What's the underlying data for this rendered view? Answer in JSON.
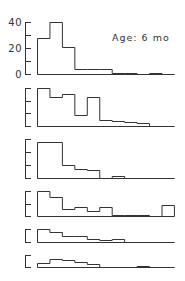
{
  "chart_data": {
    "type": "bar",
    "subtype": "stacked-panels-histogram",
    "annotation": "Age: 6 mo",
    "bins": 11,
    "x_tick_labels": [],
    "xlabel": "",
    "ylabel": "",
    "grid": false,
    "panels": [
      {
        "name": "panel-1",
        "y_tick_labels": [
          "40",
          "20",
          "0"
        ],
        "ylim": [
          0,
          40
        ],
        "y_ticks": [
          0,
          10,
          20,
          30,
          40
        ],
        "values": [
          28,
          40,
          21,
          4,
          4,
          4,
          1,
          1,
          0,
          1,
          0
        ]
      },
      {
        "name": "panel-2",
        "y_tick_labels": [],
        "ylim": [
          0,
          3
        ],
        "y_ticks": [
          0,
          1,
          2,
          3
        ],
        "values": [
          3.0,
          2.3,
          2.5,
          0.9,
          2.3,
          0.5,
          0.4,
          0.3,
          0.2,
          0,
          0
        ]
      },
      {
        "name": "panel-3",
        "y_tick_labels": [],
        "ylim": [
          0,
          3
        ],
        "y_ticks": [
          0,
          1,
          2,
          3
        ],
        "values": [
          2.8,
          2.8,
          1.0,
          0.7,
          0.6,
          0,
          0.15,
          0,
          0,
          0,
          0
        ]
      },
      {
        "name": "panel-4",
        "y_tick_labels": [],
        "ylim": [
          0,
          2
        ],
        "y_ticks": [
          0,
          1,
          2
        ],
        "values": [
          2.0,
          1.5,
          0.55,
          0.75,
          0.4,
          0.75,
          0.1,
          0.1,
          0.1,
          0,
          0.9
        ]
      },
      {
        "name": "panel-5",
        "y_tick_labels": [],
        "ylim": [
          0,
          1
        ],
        "y_ticks": [
          0,
          1
        ],
        "values": [
          1.0,
          0.77,
          0.46,
          0.46,
          0.23,
          0.15,
          0.23,
          0,
          0,
          0,
          0
        ]
      },
      {
        "name": "panel-6",
        "y_tick_labels": [],
        "ylim": [
          0,
          1
        ],
        "y_ticks": [
          0,
          1
        ],
        "values": [
          0.33,
          0.67,
          0.58,
          0.42,
          0.25,
          0,
          0,
          0,
          0.08,
          0,
          0
        ]
      }
    ]
  },
  "layout": {
    "x0": 37,
    "bin_width": 12.45,
    "axis_x": 25,
    "tick_len": 6,
    "panels_px": [
      {
        "baseline": 74,
        "top": 22
      },
      {
        "baseline": 126,
        "top": 88
      },
      {
        "baseline": 178,
        "top": 139
      },
      {
        "baseline": 216,
        "top": 191
      },
      {
        "baseline": 242,
        "top": 229
      },
      {
        "baseline": 267,
        "top": 255
      }
    ]
  }
}
